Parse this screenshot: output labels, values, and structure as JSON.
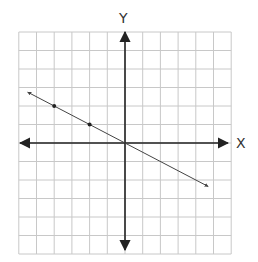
{
  "chart_data": {
    "type": "line",
    "title": "",
    "xlabel": "X",
    "ylabel": "Y",
    "xlim": [
      -6,
      6
    ],
    "ylim": [
      -6,
      6
    ],
    "grid": true,
    "series": [
      {
        "name": "line",
        "equation": "y = -0.5x",
        "slope": -0.5,
        "intercept": 0,
        "arrows": "both",
        "x": [
          -5.5,
          4.7
        ],
        "y": [
          2.75,
          -2.35
        ]
      }
    ],
    "points": [
      {
        "x": -4,
        "y": 2
      },
      {
        "x": -2,
        "y": 1
      }
    ]
  },
  "axes": {
    "x_label": "X",
    "y_label": "Y"
  }
}
